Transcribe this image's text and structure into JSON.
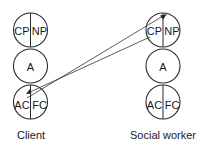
{
  "diagram": {
    "columns": [
      {
        "label": "Client",
        "ego_states": {
          "top": {
            "left": "CP",
            "right": "NP"
          },
          "middle": "A",
          "bottom": {
            "left": "AC",
            "right": "FC"
          }
        }
      },
      {
        "label": "Social worker",
        "ego_states": {
          "top": {
            "left": "CP",
            "right": "NP"
          },
          "middle": "A",
          "bottom": {
            "left": "AC",
            "right": "FC"
          }
        }
      }
    ],
    "transactions": [
      {
        "from": "Client AC",
        "to": "Social worker NP"
      },
      {
        "from": "Social worker CP",
        "to": "Client AC"
      }
    ],
    "colors": {
      "stroke": "#2a2a2a",
      "text": "#1a1a1a",
      "background": "#ffffff"
    }
  }
}
